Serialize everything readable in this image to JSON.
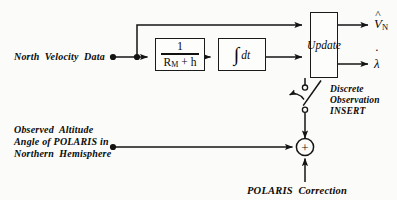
{
  "diagram": {
    "type": "block-diagram",
    "width": 397,
    "height": 200,
    "background": "#fbfbf9",
    "line_color": "#1a1a1a"
  },
  "inputs": [
    {
      "id": "north-velocity-data",
      "label": "North  Velocity  Data",
      "terminal": {
        "x": 113,
        "y": 57
      }
    },
    {
      "id": "observed-altitude-angle",
      "label_line1": "Observed  Altitude",
      "label_line2": "Angle of POLARIS in",
      "label_line3": "Northern  Hemisphere",
      "terminal": {
        "x": 113,
        "y": 147
      }
    },
    {
      "id": "polaris-correction",
      "label": "POLARIS  Correction",
      "enters": "summing-junction-from-below"
    }
  ],
  "blocks": [
    {
      "id": "gain-block",
      "name": "reciprocal-meridian-radius",
      "numerator": "1",
      "denominator_r": "R",
      "denominator_sub": "M",
      "denominator_tail": "+ h",
      "x": 155,
      "y": 38,
      "w": 50,
      "h": 33
    },
    {
      "id": "integrator-block",
      "name": "integrator",
      "symbol": "∫",
      "symbol_tail": "dt",
      "x": 218,
      "y": 38,
      "w": 48,
      "h": 33
    },
    {
      "id": "update-block",
      "name": "update",
      "label": "Update",
      "x": 310,
      "y": 12,
      "w": 28,
      "h": 66
    }
  ],
  "junctions": [
    {
      "id": "branch-node",
      "x": 137,
      "y": 57,
      "type": "dot"
    },
    {
      "id": "summing-junction",
      "x": 305,
      "y": 147,
      "r": 9,
      "sign": "+"
    }
  ],
  "switch": {
    "id": "discrete-observation-switch",
    "label_line1": "Discrete",
    "label_line2": "Observation",
    "label_line3": "INSERT",
    "upper_contact": {
      "x": 305,
      "y": 88
    },
    "lower_contact": {
      "x": 305,
      "y": 110
    },
    "state": "open"
  },
  "outputs": [
    {
      "id": "north-velocity-estimate",
      "base": "V",
      "accent": "hat",
      "subscript": "N",
      "arrow_y": 25
    },
    {
      "id": "longitude-rate-estimate",
      "base": "λ",
      "accent": "dot",
      "subscript": "",
      "arrow_y": 64
    }
  ],
  "wires": {
    "bypass_path_label": "direct feedthrough from branch node to update block",
    "forward_path_label": "gain then integrator into update block",
    "switch_path_label": "update output through discrete switch into summing junction"
  }
}
